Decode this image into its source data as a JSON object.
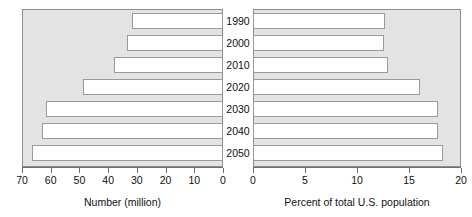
{
  "chart_data": {
    "type": "bar",
    "orientation": "horizontal",
    "layout": "back-to-back bidirectional population pyramid",
    "title": "",
    "categories": [
      "1990",
      "2000",
      "2010",
      "2020",
      "2030",
      "2040",
      "2050"
    ],
    "panels": [
      {
        "id": "left",
        "xlabel": "Number (million)",
        "ylabel": "",
        "xlim": [
          70,
          0
        ],
        "direction": "right-to-left",
        "ticks": [
          70,
          60,
          50,
          40,
          30,
          20,
          10,
          0
        ],
        "ticklabels": [
          "70",
          "60",
          "50",
          "40",
          "30",
          "20",
          "10",
          "0"
        ],
        "grid": false,
        "values": [
          31.7,
          33.4,
          38.0,
          48.8,
          61.5,
          63.0,
          66.5
        ]
      },
      {
        "id": "right",
        "xlabel": "Percent of total U.S. population",
        "ylabel": "",
        "xlim": [
          0,
          20
        ],
        "direction": "left-to-right",
        "ticks": [
          0,
          5,
          10,
          15,
          20
        ],
        "ticklabels": [
          "0",
          "5",
          "10",
          "15",
          "20"
        ],
        "grid": false,
        "values": [
          12.7,
          12.6,
          13.0,
          16.1,
          17.8,
          17.8,
          18.3
        ]
      }
    ],
    "legend": [],
    "annotations": []
  },
  "style": {
    "plot_background": "#e3e3e3",
    "bar_fill": "#ffffff",
    "bar_border": "#9a9a9a",
    "axis_color": "#6f6f6f",
    "frame_color": "#8d8d8d",
    "text_color": "#111111",
    "center_strip": "#ffffff"
  }
}
